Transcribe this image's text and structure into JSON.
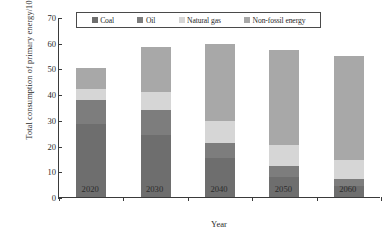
{
  "chart_data": {
    "type": "bar",
    "stacked": true,
    "title": "",
    "xlabel": "Year",
    "ylabel": "Total consumption of primary energy/10⁸tce",
    "ylabel_main": "Total consumption of primary energy/10",
    "ylabel_sup": "8",
    "ylabel_tail": "tce",
    "categories": [
      "2020",
      "2030",
      "2040",
      "2050",
      "2060"
    ],
    "ylim": [
      0,
      70
    ],
    "ytick_step": 10,
    "yticks": [
      "0",
      "10",
      "20",
      "30",
      "40",
      "50",
      "60",
      "70"
    ],
    "grid": false,
    "legend_position": "top-center",
    "series": [
      {
        "name": "Coal",
        "color": "#6e6e6e",
        "values": [
          28.5,
          24.0,
          15.0,
          7.8,
          4.2
        ]
      },
      {
        "name": "Oil",
        "color": "#7d7d7d",
        "values": [
          9.3,
          9.8,
          6.1,
          4.2,
          3.0
        ]
      },
      {
        "name": "Natural gas",
        "color": "#d6d6d6",
        "values": [
          4.4,
          7.2,
          8.4,
          8.1,
          7.3
        ]
      },
      {
        "name": "Non-fossil energy",
        "color": "#a8a8a8",
        "values": [
          7.8,
          17.5,
          30.0,
          37.2,
          40.2
        ]
      }
    ],
    "totals": [
      50.0,
      58.5,
      59.5,
      57.3,
      54.7
    ]
  },
  "legend": {
    "items": [
      {
        "label": "Coal",
        "color": "#6e6e6e"
      },
      {
        "label": "Oil",
        "color": "#7d7d7d"
      },
      {
        "label": "Natural gas",
        "color": "#d6d6d6"
      },
      {
        "label": "Non-fossil energy",
        "color": "#a8a8a8"
      }
    ]
  },
  "colors": {
    "axis": "#3a3a3a",
    "text": "#2b2b2b",
    "background": "#ffffff"
  }
}
